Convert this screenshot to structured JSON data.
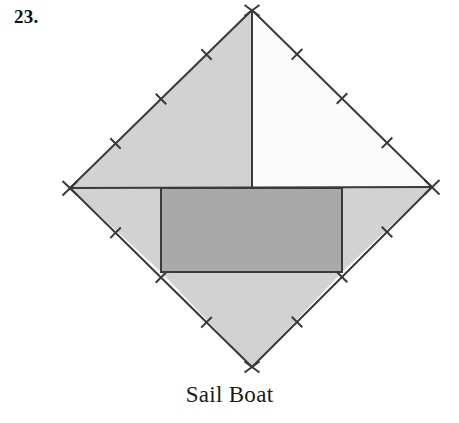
{
  "problem": {
    "number_label": "23."
  },
  "caption": {
    "text": "Sail Boat"
  },
  "figure": {
    "name": "tangram-sail-boat",
    "colors": {
      "outline": "#3a3a3a",
      "light_gray_fill": "#d2d2d2",
      "mid_gray_fill": "#a9a9a9",
      "white_fill": "#fbfbfb",
      "background": "#ffffff",
      "text": "#111111"
    },
    "geometry": {
      "diamond": {
        "top": [
          252,
          10
        ],
        "right": [
          432,
          187
        ],
        "bottom": [
          252,
          367
        ],
        "left": [
          70,
          188
        ]
      },
      "mast_line": {
        "from": [
          252,
          10
        ],
        "to": [
          252,
          188
        ]
      },
      "waterline": {
        "from": [
          70,
          188
        ],
        "to": [
          432,
          187
        ]
      },
      "hull_rect": {
        "left": 161,
        "top": 188,
        "right": 342,
        "bottom": 272
      },
      "hull_divider_x": 342,
      "stroke_width": 2
    },
    "pieces": [
      {
        "name": "upper-left-sail-triangle",
        "fill": "light_gray_fill"
      },
      {
        "name": "upper-right-sail-triangle",
        "fill": "white_fill"
      },
      {
        "name": "hull-rectangle",
        "fill": "mid_gray_fill"
      },
      {
        "name": "left-wing-triangle",
        "fill": "light_gray_fill"
      },
      {
        "name": "right-wing-triangle",
        "fill": "light_gray_fill"
      },
      {
        "name": "bottom-keel-triangle",
        "fill": "light_gray_fill"
      }
    ],
    "tick_marks": {
      "per_edge": 3,
      "vertex_crosses": 4,
      "length": 15,
      "description": "congruence hatch marks perpendicular to each diamond edge"
    }
  }
}
